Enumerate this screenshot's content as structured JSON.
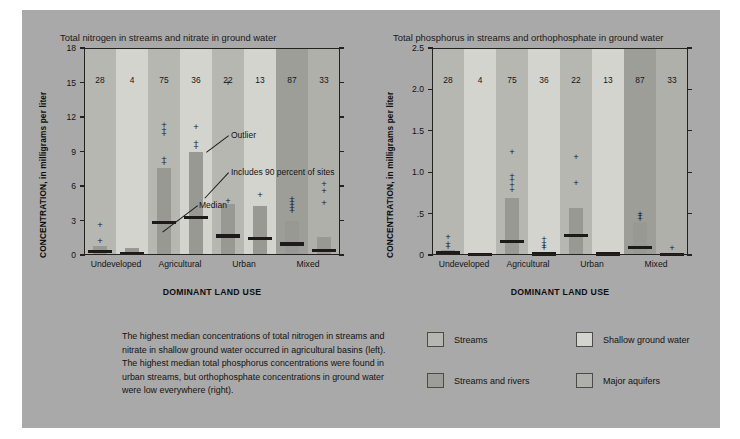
{
  "figure": {
    "background_color": "#a9a9a9",
    "bar_color": "#999994",
    "median_color": "#1c1b19",
    "axis_color": "#23221f"
  },
  "caption": {
    "text": "The highest median concentrations of total nitrogen in streams and nitrate in shallow ground water occurred in agricultural basins (left). The highest median total phosphorus concentrations were found in urban streams, but orthophosphate concentrations in ground water were low everywhere (right)."
  },
  "legend": {
    "items": [
      {
        "label": "Streams",
        "color": "#b7b7b2"
      },
      {
        "label": "Shallow ground water",
        "color": "#d4d4cf"
      },
      {
        "label": "Streams and rivers",
        "color": "#9e9e99"
      },
      {
        "label": "Major aquifers",
        "color": "#b0b0ab"
      }
    ]
  },
  "annotations": {
    "outlier": "Outlier",
    "box_range": "Includes 90 percent of sites",
    "median": "Median",
    "number_of_sites": "Number of sites"
  },
  "chart_data": [
    {
      "type": "bar",
      "id": "total-nitrogen",
      "title": "Total nitrogen in streams and nitrate in ground water",
      "ylabel": "CONCENTRATION, in milligrams per liter",
      "xlabel": "DOMINANT LAND USE",
      "ylim": [
        0,
        18
      ],
      "yticks": [
        "0",
        "3",
        "6",
        "9",
        "12",
        "15",
        "18"
      ],
      "ytick_values": [
        0,
        3,
        6,
        9,
        12,
        15,
        18
      ],
      "grid": false,
      "categories": [
        "Undeveloped",
        "Agricultural",
        "Urban",
        "Mixed"
      ],
      "series_labels": [
        "Streams",
        "Shallow ground water",
        "Streams",
        "Shallow ground water",
        "Streams",
        "Shallow ground water",
        "Streams and rivers",
        "Major aquifers"
      ],
      "columns": [
        {
          "land_use": "Undeveloped",
          "water": "Streams",
          "band_color": "#b7b7b2",
          "n_sites": 28,
          "box_low": 0.05,
          "box_high": 0.75,
          "median": 0.3,
          "outliers": [
            1.25,
            2.6
          ]
        },
        {
          "land_use": "Undeveloped",
          "water": "Shallow ground water",
          "band_color": "#d4d4cf",
          "n_sites": 4,
          "box_low": 0.0,
          "box_high": 0.65,
          "median": 0.1,
          "outliers": []
        },
        {
          "land_use": "Agricultural",
          "water": "Streams",
          "band_color": "#b7b7b2",
          "n_sites": 75,
          "box_low": 0.05,
          "box_high": 7.6,
          "median": 2.8,
          "outliers": [
            8.0,
            8.35,
            10.5,
            10.9,
            11.3
          ]
        },
        {
          "land_use": "Agricultural",
          "water": "Shallow ground water",
          "band_color": "#d4d4cf",
          "n_sites": 36,
          "box_low": 0.05,
          "box_high": 8.95,
          "median": 3.25,
          "outliers": [
            9.35,
            9.75,
            11.1
          ]
        },
        {
          "land_use": "Urban",
          "water": "Streams",
          "band_color": "#b7b7b2",
          "n_sites": 22,
          "box_low": 0.05,
          "box_high": 4.4,
          "median": 1.65,
          "outliers": [
            4.7,
            15.0
          ]
        },
        {
          "land_use": "Urban",
          "water": "Shallow ground water",
          "band_color": "#d4d4cf",
          "n_sites": 13,
          "box_low": 0.05,
          "box_high": 4.25,
          "median": 1.45,
          "outliers": [
            5.25
          ]
        },
        {
          "land_use": "Mixed",
          "water": "Streams and rivers",
          "band_color": "#9e9e99",
          "n_sites": 87,
          "box_low": 0.05,
          "box_high": 3.0,
          "median": 0.95,
          "outliers": [
            3.85,
            4.1,
            4.35,
            4.6,
            4.85
          ]
        },
        {
          "land_use": "Mixed",
          "water": "Major aquifers",
          "band_color": "#b0b0ab",
          "n_sites": 33,
          "box_low": 0.0,
          "box_high": 1.6,
          "median": 0.4,
          "outliers": [
            4.55,
            5.6,
            6.2
          ]
        }
      ]
    },
    {
      "type": "bar",
      "id": "total-phosphorus",
      "title": "Total phosphorus in streams and orthophosphate in ground water",
      "ylabel": "CONCENTRATION, in milligrams per liter",
      "xlabel": "DOMINANT LAND USE",
      "ylim": [
        0,
        2.5
      ],
      "yticks": [
        "0",
        ".5",
        "1.0",
        "1.5",
        "2.0",
        "2.5"
      ],
      "ytick_values": [
        0,
        0.5,
        1.0,
        1.5,
        2.0,
        2.5
      ],
      "grid": false,
      "categories": [
        "Undeveloped",
        "Agricultural",
        "Urban",
        "Mixed"
      ],
      "series_labels": [
        "Streams",
        "Shallow ground water",
        "Streams",
        "Shallow ground water",
        "Streams",
        "Shallow ground water",
        "Streams and rivers",
        "Major aquifers"
      ],
      "columns": [
        {
          "land_use": "Undeveloped",
          "water": "Streams",
          "band_color": "#b7b7b2",
          "n_sites": 28,
          "box_low": 0.0,
          "box_high": 0.06,
          "median": 0.035,
          "outliers": [
            0.1,
            0.13,
            0.22
          ]
        },
        {
          "land_use": "Undeveloped",
          "water": "Shallow ground water",
          "band_color": "#d4d4cf",
          "n_sites": 4,
          "box_low": 0.0,
          "box_high": 0.02,
          "median": 0.01,
          "outliers": []
        },
        {
          "land_use": "Agricultural",
          "water": "Streams",
          "band_color": "#b7b7b2",
          "n_sites": 75,
          "box_low": 0.0,
          "box_high": 0.69,
          "median": 0.165,
          "outliers": [
            0.78,
            0.84,
            0.9,
            0.96,
            1.24
          ]
        },
        {
          "land_use": "Agricultural",
          "water": "Shallow ground water",
          "band_color": "#d4d4cf",
          "n_sites": 36,
          "box_low": 0.0,
          "box_high": 0.03,
          "median": 0.012,
          "outliers": [
            0.08,
            0.11,
            0.15,
            0.19
          ]
        },
        {
          "land_use": "Urban",
          "water": "Streams",
          "band_color": "#b7b7b2",
          "n_sites": 22,
          "box_low": 0.0,
          "box_high": 0.57,
          "median": 0.235,
          "outliers": [
            0.87,
            1.18
          ]
        },
        {
          "land_use": "Urban",
          "water": "Shallow ground water",
          "band_color": "#d4d4cf",
          "n_sites": 13,
          "box_low": 0.0,
          "box_high": 0.02,
          "median": 0.012,
          "outliers": []
        },
        {
          "land_use": "Mixed",
          "water": "Streams and rivers",
          "band_color": "#9e9e99",
          "n_sites": 87,
          "box_low": 0.0,
          "box_high": 0.4,
          "median": 0.09,
          "outliers": [
            0.44,
            0.47,
            0.5
          ]
        },
        {
          "land_use": "Mixed",
          "water": "Major aquifers",
          "band_color": "#b0b0ab",
          "n_sites": 33,
          "box_low": 0.0,
          "box_high": 0.02,
          "median": 0.01,
          "outliers": [
            0.09
          ]
        }
      ]
    }
  ]
}
